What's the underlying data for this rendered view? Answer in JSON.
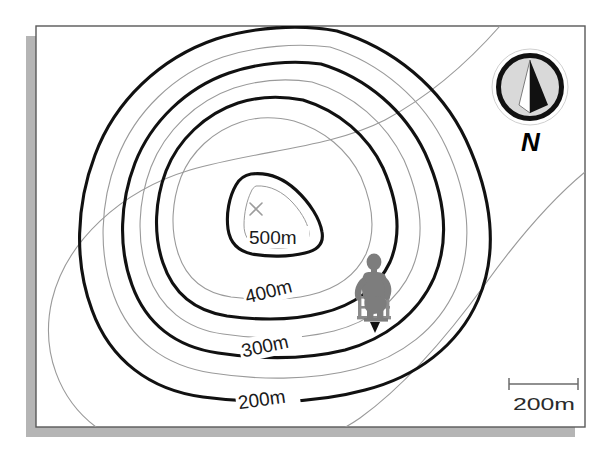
{
  "figure": {
    "kind": "topographic-contour-map",
    "page": {
      "background_color": "#ffffff",
      "border_color": "#4d4d4d",
      "shadow_color": "#b3b3b3"
    }
  },
  "map": {
    "contour_interval_m": 50,
    "index_contour_color": "#111111",
    "intermediate_contour_color": "#9a9a9a",
    "summit_marker": {
      "name": "summit-x-marker",
      "symbol": "×",
      "color": "#9c9c9c"
    },
    "contours": [
      {
        "elevation_m": 550,
        "label": "",
        "type": "intermediate"
      },
      {
        "elevation_m": 500,
        "label": "500m",
        "type": "index"
      },
      {
        "elevation_m": 450,
        "label": "",
        "type": "intermediate"
      },
      {
        "elevation_m": 400,
        "label": "400m",
        "type": "index"
      },
      {
        "elevation_m": 350,
        "label": "",
        "type": "intermediate"
      },
      {
        "elevation_m": 300,
        "label": "300m",
        "type": "index"
      },
      {
        "elevation_m": 250,
        "label": "",
        "type": "intermediate"
      },
      {
        "elevation_m": 200,
        "label": "200m",
        "type": "index"
      },
      {
        "elevation_m": 150,
        "label": "",
        "type": "intermediate"
      }
    ],
    "labels": [
      {
        "text": "500m",
        "elevation_m": 500,
        "rotation_deg": 0
      },
      {
        "text": "400m",
        "elevation_m": 400,
        "rotation_deg": -14
      },
      {
        "text": "300m",
        "elevation_m": 300,
        "rotation_deg": -12
      },
      {
        "text": "200m",
        "elevation_m": 200,
        "rotation_deg": -8
      }
    ]
  },
  "hiker": {
    "name": "hiker-figure",
    "color": "#808080",
    "position_marker": {
      "name": "position-triangle-marker",
      "color": "#111111"
    }
  },
  "compass": {
    "label": "N",
    "ring_color": "#111111",
    "dial_color": "#d9d9d9",
    "needle_light_color": "#ffffff",
    "needle_dark_color": "#111111"
  },
  "scale_bar": {
    "label": "200m",
    "distance_m": 200,
    "line_color": "#6b6b6b"
  }
}
